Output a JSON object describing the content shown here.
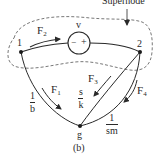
{
  "figure": {
    "caption": "(b)",
    "supernode_label": "Supernode",
    "nodes": [
      {
        "id": "1",
        "label": "1"
      },
      {
        "id": "2",
        "label": "2"
      },
      {
        "id": "g",
        "label": "g"
      }
    ],
    "source": {
      "label": "v",
      "minus": "−",
      "plus": "+"
    },
    "flows": {
      "F1": {
        "name": "F",
        "sub": "1"
      },
      "F2": {
        "name": "F",
        "sub": "2"
      },
      "F3": {
        "name": "F",
        "sub": "3"
      },
      "F4": {
        "name": "F",
        "sub": "4"
      }
    },
    "edges": {
      "e1g": {
        "num": "1",
        "den": "b"
      },
      "e2g_inner": {
        "num": "s",
        "den": "k"
      },
      "e2g_outer": {
        "num": "1",
        "den": "sm"
      }
    },
    "colors": {
      "ink": "#2a2a2a",
      "background": "#ffffff"
    }
  }
}
